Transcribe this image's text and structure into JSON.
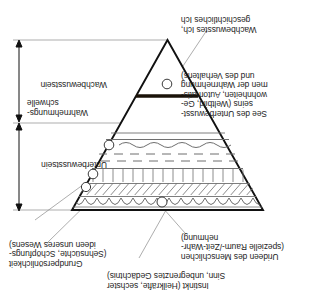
{
  "diagram": {
    "orientation": "rotated-180",
    "labels": {
      "instinkt": "Instinkt (Heilkräfte, sechster\nSinn, unbegrenztes Gedächtnis)",
      "urideen": "Urideen des Menschlichen\n(spezielle Raum-/Zeit-Wahr-\nnehmung)",
      "grundpersoenlichkeit": "Grundpersönlichkeit\n(Sehnsüchte, Schöpfungs-\nideen unseres Wesens)",
      "see_unterbewusstsein": "See des Unterbewusst-\nseins (Weltbild, Ge-\nwohnheiten, Automatis-\nmen der Wahrnehmung\nund des Verhaltens)",
      "wachbewusstes_ich": "Wachbewusstes Ich,\ngeschichtliches Ich",
      "unterbewusstsein": "Unterbewusstsein",
      "wahrnehmungsschwelle": "Wahrnehmungs-\nschwelle",
      "wachbewusstsein": "Wachbewusstsein"
    },
    "bands": [
      {
        "name": "wave-band",
        "pattern": "scalloped-waves"
      },
      {
        "name": "diagonal-hatch-band",
        "pattern": "diagonal-hatch"
      },
      {
        "name": "vertical-hatch-band",
        "pattern": "vertical-lines"
      },
      {
        "name": "dashed-band",
        "pattern": "dashes"
      },
      {
        "name": "wavy-line-band",
        "pattern": "wavy-line"
      },
      {
        "name": "threshold-line",
        "pattern": "solid-thick"
      }
    ],
    "colors": {
      "ink": "#1c1c1c",
      "outline": "#111111",
      "hatch": "#6f6f6f",
      "leader": "#7c7c7c",
      "threshold": "#1a1208"
    }
  }
}
